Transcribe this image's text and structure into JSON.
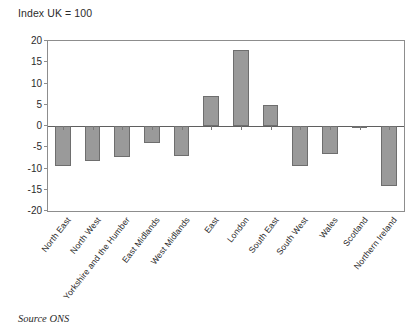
{
  "chart_data": {
    "type": "bar",
    "title": "Index UK = 100",
    "xlabel": "",
    "ylabel": "",
    "ylim": [
      -20,
      20
    ],
    "yticks": [
      20,
      15,
      10,
      5,
      0,
      -5,
      -10,
      -15,
      -20
    ],
    "grid": false,
    "legend": null,
    "source": "Source ONS",
    "categories": [
      "North East",
      "North West",
      "Yorkshire and the Humber",
      "East Midlands",
      "West Midlands",
      "East",
      "London",
      "South East",
      "South West",
      "Wales",
      "Scotland",
      "Northern Ireland"
    ],
    "values": [
      -9.5,
      -8.3,
      -7.3,
      -4.0,
      -7.0,
      7.0,
      18.0,
      5.0,
      -9.5,
      -6.5,
      -0.4,
      -14.0
    ],
    "bar_color": "#9a9a9a",
    "bar_border_color": "#6e6e6e"
  }
}
